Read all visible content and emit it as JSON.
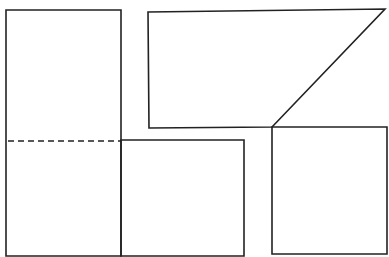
{
  "diagram": {
    "background": "#ffffff",
    "stroke_color": "#222222",
    "shapes": [
      {
        "id": "left-tall-rectangle",
        "type": "polygon",
        "points": "6,10 121,10 121,256 6,256"
      },
      {
        "id": "lower-middle-rectangle",
        "type": "polygon",
        "points": "121,140 244,140 244,256 121,256"
      },
      {
        "id": "upper-right-trapezoid",
        "type": "polygon",
        "points": "148,12 385,9 272,127 149,128"
      },
      {
        "id": "lower-right-rectangle",
        "type": "polygon",
        "points": "272,127 387,9 387,254 272,254"
      }
    ],
    "dashed_lines": [
      {
        "id": "fold-line",
        "x1": 8,
        "y1": 141,
        "x2": 121,
        "y2": 141
      }
    ]
  }
}
